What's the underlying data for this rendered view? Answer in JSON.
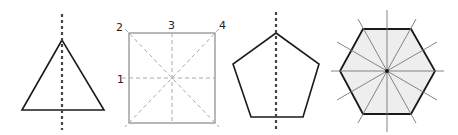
{
  "figure": {
    "shapes": [
      {
        "name": "triangle",
        "lines_of_symmetry_shown": 1
      },
      {
        "name": "square",
        "labels": [
          "1",
          "2",
          "3",
          "4"
        ],
        "lines_of_symmetry_shown": 4
      },
      {
        "name": "pentagon",
        "lines_of_symmetry_shown": 1
      },
      {
        "name": "hexagon",
        "lines_of_symmetry_shown": 6
      }
    ],
    "square_labels": {
      "l1": "1",
      "l2": "2",
      "l3": "3",
      "l4": "4"
    },
    "colors": {
      "stroke": "#1a1a1a",
      "square_stroke": "#999999",
      "dashed_light": "#aaaaaa",
      "hexagon_fill": "#eeeeee",
      "hexagon_lines": "#777777"
    }
  }
}
